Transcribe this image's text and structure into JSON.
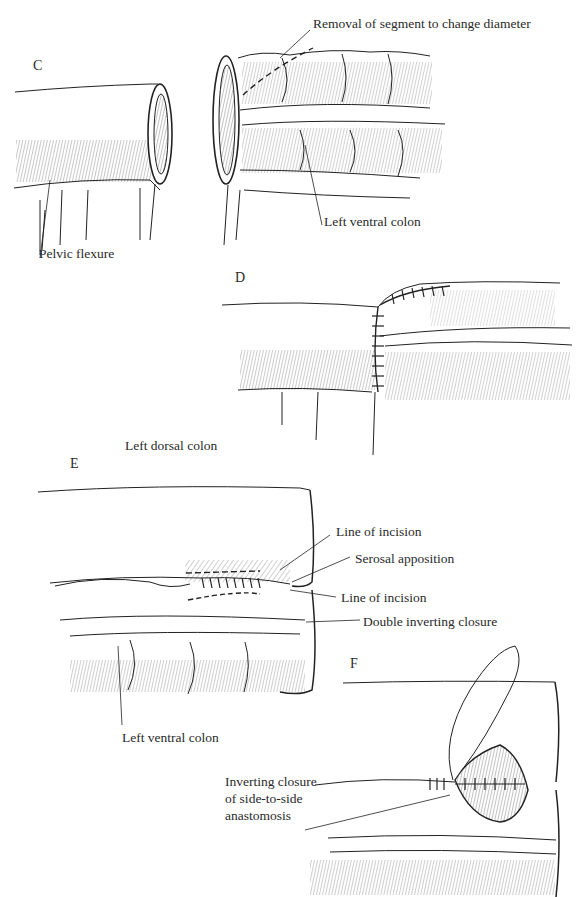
{
  "figure": {
    "panels": [
      {
        "id": "C",
        "label": "C"
      },
      {
        "id": "D",
        "label": "D"
      },
      {
        "id": "E",
        "label": "E"
      },
      {
        "id": "F",
        "label": "F"
      }
    ],
    "labels": {
      "removal_segment": "Removal of segment to change diameter",
      "left_ventral_colon_c": "Left ventral colon",
      "pelvic_flexure": "Pelvic flexure",
      "left_dorsal_colon": "Left dorsal colon",
      "line_of_incision_1": "Line of incision",
      "serosal_apposition": "Serosal apposition",
      "line_of_incision_2": "Line of incision",
      "double_inverting_closure": "Double inverting closure",
      "left_ventral_colon_e": "Left ventral colon",
      "inverting_closure_l1": "Inverting closure",
      "inverting_closure_l2": "of side-to-side",
      "inverting_closure_l3": "anastomosis"
    }
  }
}
